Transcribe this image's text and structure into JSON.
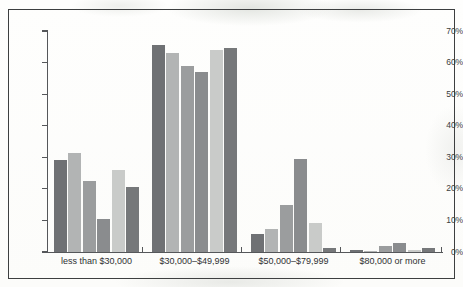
{
  "chart_data": {
    "type": "bar",
    "title": "",
    "subtitle": "",
    "xlabel": "",
    "ylabel": "",
    "ylim": [
      0,
      70
    ],
    "ytick_labels": [
      "0%",
      "10%",
      "20%",
      "30%",
      "40%",
      "50%",
      "60%",
      "70%"
    ],
    "ytick_values": [
      0,
      10,
      20,
      30,
      40,
      50,
      60,
      70
    ],
    "grid": false,
    "legend": "none",
    "orientation": "vertical",
    "grouped": true,
    "categories": [
      "less than $30,000",
      "$30,000–$49,999",
      "$50,000–$79,999",
      "$80,000 or more"
    ],
    "series": [
      {
        "name": "series-1",
        "color": "#6f7174",
        "values": [
          29.0,
          65.5,
          5.8,
          0.7
        ]
      },
      {
        "name": "series-2",
        "color": "#b2b4b4",
        "values": [
          31.2,
          63.0,
          7.3,
          0.4
        ]
      },
      {
        "name": "series-3",
        "color": "#9b9d9e",
        "values": [
          22.5,
          59.0,
          15.0,
          2.0
        ]
      },
      {
        "name": "series-4",
        "color": "#8a8c8e",
        "values": [
          10.5,
          57.0,
          29.5,
          3.0
        ]
      },
      {
        "name": "series-5",
        "color": "#c9cbc9",
        "values": [
          26.0,
          64.0,
          9.3,
          0.7
        ]
      },
      {
        "name": "series-6",
        "color": "#76787a",
        "values": [
          20.7,
          64.5,
          1.2,
          1.2
        ]
      }
    ],
    "colors": {
      "axis": "#55575a",
      "border": "#3d3f40",
      "background": "#fdfdfb",
      "tick_text": "#3a3c3e"
    }
  }
}
